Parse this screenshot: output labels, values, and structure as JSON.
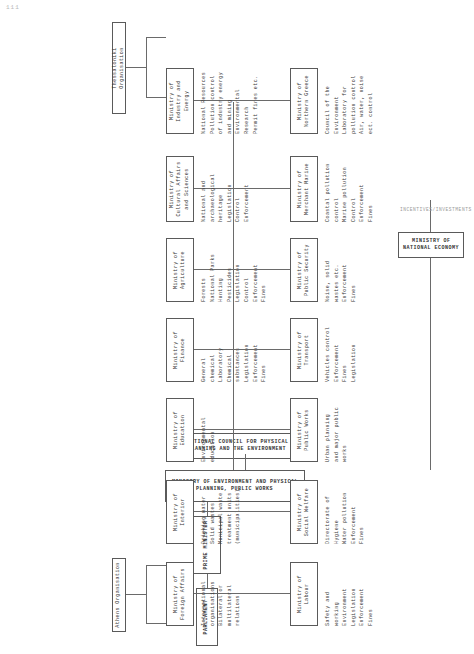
{
  "page": {
    "corner_mark": "111",
    "title_hidden": "Greek environmental administration organisation chart"
  },
  "top": {
    "parliament": "PARLIAMENT",
    "prime_minister": "PRIME MINISTER",
    "ministry_env": "MINISTRY OF ENVIRONMENT AND PHYSICAL PLANNING, PUBLIC WORKS",
    "council": "NATIONAL COUNCIL FOR PHYSICAL PLANNING\nAND THE ENVIRONMENT"
  },
  "side_labels": {
    "athens": "Athens Organisation",
    "thessaloniki": "Thessaloniki Organisation",
    "incentives": "INCENTIVES/INVESTMENTS"
  },
  "upper_row": [
    {
      "name": "ministry-foreign-affairs",
      "box": "Ministry of\nForeign Affairs",
      "items": "International\norganisations\nBilateral or\nmultilateral\nrelations"
    },
    {
      "name": "ministry-interior",
      "box": "Ministry of\nInterior",
      "items": "Drinking water\nSolid wastes\nMunicipal waste\ntreatment units\n(municipalities)"
    },
    {
      "name": "ministry-education",
      "box": "Ministry of\nEducation",
      "items": "Environmental\neducation"
    },
    {
      "name": "ministry-finance",
      "box": "Ministry of\nFinance",
      "items": "General\nchemical\nLaboratory\nChemical\nsubstances\nLegislation\nEnforcement\nFines"
    },
    {
      "name": "ministry-agriculture",
      "box": "Ministry of\nAgriculture",
      "items": "Forests\nNational Parks\nHunting\nPesticides\nLegislation\nControl\nEnforcement\nFines"
    },
    {
      "name": "ministry-cultural-affairs",
      "box": "Ministry of\nCultural Affairs\nand Sciences",
      "items": "National and\narchaeological\nheritage\nLegislation\nControl\nEnforcement"
    },
    {
      "name": "ministry-industry-energy",
      "box": "Ministry of\nIndustry and\nEnergy",
      "items": "National Resources\nPollution control\nof industry energy\nand mining\nEnvironmental\nResearch\nPermit fines etc."
    }
  ],
  "lower_row": [
    {
      "name": "ministry-labour",
      "box": "Ministry of\nLabour",
      "items": "Safety and\nworking\nEnvironment\nLegislation\nEnforcement\nFines"
    },
    {
      "name": "ministry-social-welfare",
      "box": "Ministry of\nSocial Welfare",
      "items": "Directorate of\nHygiene\nWater pollution\nEnforcement\nFines"
    },
    {
      "name": "ministry-public-works",
      "box": "Ministry of\nPublic Works",
      "items": "Urban planning\nand major public\nworks"
    },
    {
      "name": "ministry-transport",
      "box": "Ministry of\nTransport",
      "items": "Vehicles control\nEnforcement\nFines\nLegislation"
    },
    {
      "name": "ministry-public-security",
      "box": "Ministry of\nPublic Security",
      "items": "Noise, solid\nwastes etc.\nEnforcement\nFines"
    },
    {
      "name": "ministry-merchant-marine",
      "box": "Ministry of\nMerchant Marine",
      "items": "Coastal pollution\ncontrol\nMarine pollution\nControl\nEnforcement\nFines"
    },
    {
      "name": "ministry-northern-greece",
      "box": "Ministry of\nNorthern Greece",
      "items": "Council of the\nEnvironment\nLaboratory for\npollution control\nAir, water, noise\nect. control"
    }
  ],
  "economy": {
    "box": "MINISTRY OF NATIONAL ECONOMY"
  },
  "colors": {
    "line": "#6a6a6a",
    "border": "#5a5a5a",
    "text": "#333333",
    "background": "#ffffff"
  }
}
